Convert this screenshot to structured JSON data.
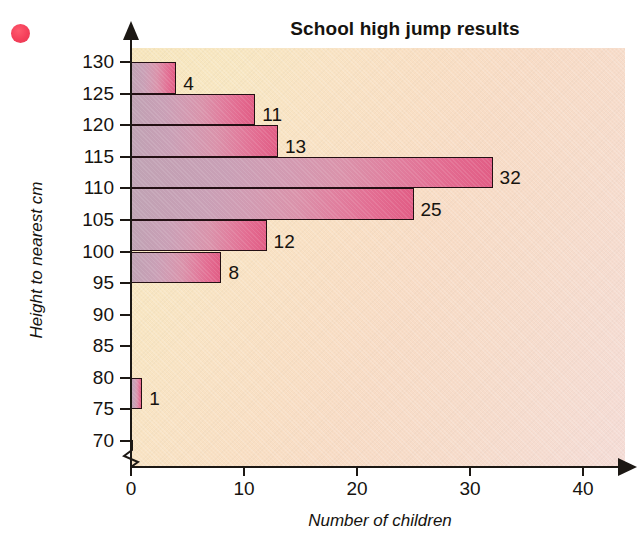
{
  "chart_data": {
    "type": "bar",
    "orientation": "horizontal",
    "title": "School high jump results",
    "xlabel": "Number of children",
    "ylabel": "Height to nearest cm",
    "xlim": [
      0,
      44
    ],
    "ylim": [
      70,
      132
    ],
    "grid": false,
    "legend": null,
    "x_ticks": [
      "0",
      "10",
      "20",
      "30",
      "40"
    ],
    "x_tick_values": [
      0,
      10,
      20,
      30,
      40
    ],
    "y_ticks": [
      "130",
      "125",
      "120",
      "115",
      "110",
      "105",
      "100",
      "95",
      "90",
      "85",
      "80",
      "75",
      "70"
    ],
    "y_tick_values": [
      130,
      125,
      120,
      115,
      110,
      105,
      100,
      95,
      90,
      85,
      80,
      75,
      70
    ],
    "axis_break": true,
    "bins": [
      {
        "label": "125-130",
        "bin_low": 125,
        "bin_high": 130,
        "value": 4,
        "data_label": "4"
      },
      {
        "label": "120-125",
        "bin_low": 120,
        "bin_high": 125,
        "value": 11,
        "data_label": "11"
      },
      {
        "label": "115-120",
        "bin_low": 115,
        "bin_high": 120,
        "value": 13,
        "data_label": "13"
      },
      {
        "label": "110-115",
        "bin_low": 110,
        "bin_high": 115,
        "value": 32,
        "data_label": "32"
      },
      {
        "label": "105-110",
        "bin_low": 105,
        "bin_high": 110,
        "value": 25,
        "data_label": "25"
      },
      {
        "label": "100-105",
        "bin_low": 100,
        "bin_high": 105,
        "value": 12,
        "data_label": "12"
      },
      {
        "label": "95-100",
        "bin_low": 95,
        "bin_high": 100,
        "value": 8,
        "data_label": "8"
      },
      {
        "label": "90-95",
        "bin_low": 90,
        "bin_high": 95,
        "value": 0,
        "data_label": ""
      },
      {
        "label": "85-90",
        "bin_low": 85,
        "bin_high": 90,
        "value": 0,
        "data_label": ""
      },
      {
        "label": "80-85",
        "bin_low": 80,
        "bin_high": 85,
        "value": 0,
        "data_label": ""
      },
      {
        "label": "75-80",
        "bin_low": 75,
        "bin_high": 80,
        "value": 1,
        "data_label": "1"
      },
      {
        "label": "70-75",
        "bin_low": 70,
        "bin_high": 75,
        "value": 0,
        "data_label": ""
      }
    ],
    "categories": [
      "125-130",
      "120-125",
      "115-120",
      "110-115",
      "105-110",
      "100-105",
      "95-100",
      "90-95",
      "85-90",
      "80-85",
      "75-80",
      "70-75"
    ],
    "values": [
      4,
      11,
      13,
      32,
      25,
      12,
      8,
      0,
      0,
      0,
      1,
      0
    ]
  },
  "colors": {
    "bar_gradient_start": "#c0a3b4",
    "bar_gradient_end": "#e15d85",
    "bar_outline": "#241014",
    "background_start": "#f7e6bd",
    "background_end": "#f5dcd6",
    "axis": "#1c1814",
    "text": "#16130f",
    "marker_dot": "#f43f5a"
  }
}
